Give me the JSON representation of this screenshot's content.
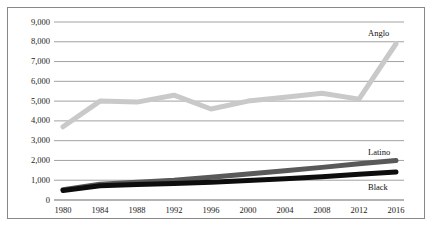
{
  "figure": {
    "border_color": "#888888",
    "background": "#ffffff",
    "gridline_color": "#8a8a8a",
    "axis_color": "#6a6a6a"
  },
  "chart_data": {
    "type": "line",
    "title": "",
    "subtitle": "",
    "xlabel": "",
    "ylabel": "",
    "grid": true,
    "grid_axis": "y",
    "legend_position": "inline-right-end-labels",
    "x": [
      1980,
      1984,
      1988,
      1992,
      1996,
      2000,
      2004,
      2008,
      2012,
      2016
    ],
    "xtick_labels": [
      "1980",
      "1984",
      "1988",
      "1992",
      "1996",
      "2000",
      "2004",
      "2008",
      "2012",
      "2016"
    ],
    "xlim": [
      1980,
      2016
    ],
    "ylim": [
      0,
      9000
    ],
    "ytick_values": [
      0,
      1000,
      2000,
      3000,
      4000,
      5000,
      6000,
      7000,
      8000,
      9000
    ],
    "ytick_labels": [
      "0",
      "1,000",
      "2,000",
      "3,000",
      "4,000",
      "5,000",
      "6,000",
      "7,000",
      "8,000",
      "9,000"
    ],
    "series": [
      {
        "name": "Anglo",
        "label": "Anglo",
        "color": "#c9c9c9",
        "line_width": 5,
        "values": [
          3700,
          5000,
          4950,
          5300,
          4600,
          5000,
          5200,
          5400,
          5100,
          7900
        ]
      },
      {
        "name": "Latino",
        "label": "Latino",
        "color": "#595959",
        "line_width": 5,
        "values": [
          520,
          800,
          900,
          1000,
          1150,
          1320,
          1480,
          1650,
          1830,
          2000
        ]
      },
      {
        "name": "Black",
        "label": "Black",
        "color": "#0d0d0d",
        "line_width": 5,
        "values": [
          480,
          720,
          780,
          830,
          900,
          980,
          1080,
          1180,
          1300,
          1420
        ]
      }
    ]
  }
}
